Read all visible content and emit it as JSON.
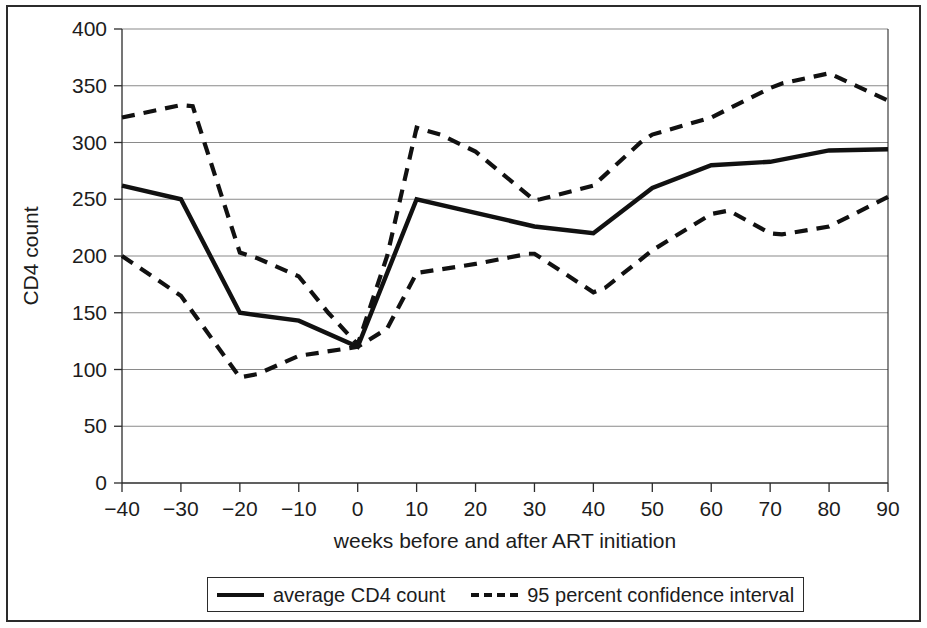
{
  "figure": {
    "background": "#ffffff",
    "frame_color": "#2b2b2b",
    "line_color": "#111111",
    "grid_color": "#8a8a8a"
  },
  "axes": {
    "y_title": "CD4 count",
    "x_title": "weeks before and after ART initiation",
    "y_ticks": [
      "0",
      "50",
      "100",
      "150",
      "200",
      "250",
      "300",
      "350",
      "400"
    ],
    "x_ticks": [
      "−40",
      "−30",
      "−20",
      "−10",
      "0",
      "10",
      "20",
      "30",
      "40",
      "50",
      "60",
      "70",
      "80",
      "90"
    ]
  },
  "legend": {
    "average_label": "average CD4 count",
    "ci_label": "95 percent confidence interval"
  },
  "chart_data": {
    "type": "line",
    "title": "",
    "xlabel": "weeks before and after ART initiation",
    "ylabel": "CD4 count",
    "xlim": [
      -40,
      90
    ],
    "ylim": [
      0,
      400
    ],
    "yticks": [
      0,
      50,
      100,
      150,
      200,
      250,
      300,
      350,
      400
    ],
    "xticks": [
      -40,
      -30,
      -20,
      -10,
      0,
      10,
      20,
      30,
      40,
      50,
      60,
      70,
      80,
      90
    ],
    "grid": "horizontal",
    "legend_position": "below-axes",
    "series": [
      {
        "name": "average CD4 count",
        "style": "solid",
        "color": "#111111",
        "x": [
          -40,
          -30,
          -20,
          -10,
          0,
          10,
          20,
          30,
          40,
          50,
          60,
          70,
          80,
          90
        ],
        "values": [
          262,
          250,
          150,
          143,
          120,
          250,
          238,
          226,
          220,
          260,
          280,
          283,
          293,
          294
        ]
      },
      {
        "name": "95 percent confidence interval upper",
        "style": "dashed",
        "color": "#111111",
        "x": [
          -40,
          -30,
          -28,
          -20,
          -17,
          -10,
          -5,
          0,
          5,
          10,
          14,
          20,
          30,
          31,
          40,
          48,
          50,
          60,
          70,
          72,
          80,
          90
        ],
        "values": [
          322,
          333,
          332,
          203,
          198,
          182,
          150,
          122,
          200,
          313,
          307,
          292,
          249,
          250,
          262,
          300,
          307,
          322,
          348,
          352,
          361,
          337
        ]
      },
      {
        "name": "95 percent confidence interval lower",
        "style": "dashed",
        "color": "#111111",
        "x": [
          -40,
          -30,
          -20,
          -17,
          -10,
          0,
          5,
          10,
          20,
          29,
          30,
          40,
          42,
          50,
          60,
          63,
          70,
          72,
          80,
          90
        ],
        "values": [
          200,
          165,
          93,
          96,
          112,
          120,
          136,
          185,
          193,
          202,
          202,
          168,
          172,
          205,
          237,
          240,
          220,
          219,
          226,
          252
        ]
      }
    ]
  }
}
